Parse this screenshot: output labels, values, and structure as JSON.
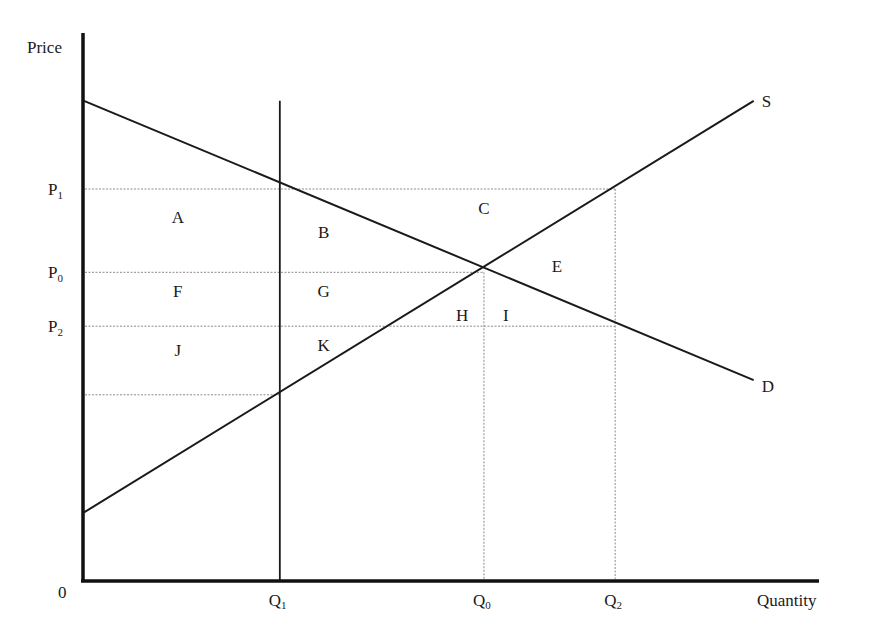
{
  "diagram": {
    "type": "supply-demand",
    "axes": {
      "y_label": "Price",
      "x_label": "Quantity",
      "origin_label": "0"
    },
    "price_levels": [
      {
        "id": "P1",
        "base": "P",
        "sub": "1",
        "value": 0.8
      },
      {
        "id": "P0",
        "base": "P",
        "sub": "0",
        "value": 0.63
      },
      {
        "id": "P2",
        "base": "P",
        "sub": "2",
        "value": 0.52
      },
      {
        "id": "Ps",
        "base": "",
        "sub": "",
        "value": 0.38
      }
    ],
    "quantity_levels": [
      {
        "id": "Q1",
        "base": "Q",
        "sub": "1",
        "value": 0.27
      },
      {
        "id": "Q0",
        "base": "Q",
        "sub": "0",
        "value": 0.55
      },
      {
        "id": "Q2",
        "base": "Q",
        "sub": "2",
        "value": 0.73
      }
    ],
    "curves": {
      "demand": {
        "label": "D",
        "from": [
          0,
          0.98
        ],
        "to": [
          0.92,
          0.41
        ]
      },
      "supply": {
        "label": "S",
        "from": [
          0,
          0.14
        ],
        "to": [
          0.92,
          0.98
        ]
      },
      "quota": {
        "label": "",
        "x": 0.27,
        "y_top": 0.98
      }
    },
    "area_labels": [
      {
        "text": "A",
        "q": 0.13,
        "p": 0.73
      },
      {
        "text": "B",
        "q": 0.33,
        "p": 0.7
      },
      {
        "text": "C",
        "q": 0.55,
        "p": 0.75
      },
      {
        "text": "E",
        "q": 0.65,
        "p": 0.63
      },
      {
        "text": "F",
        "q": 0.13,
        "p": 0.58
      },
      {
        "text": "G",
        "q": 0.33,
        "p": 0.58
      },
      {
        "text": "H",
        "q": 0.52,
        "p": 0.53
      },
      {
        "text": "I",
        "q": 0.58,
        "p": 0.53
      },
      {
        "text": "J",
        "q": 0.13,
        "p": 0.46
      },
      {
        "text": "K",
        "q": 0.33,
        "p": 0.47
      }
    ],
    "colors": {
      "line": "#1a1a1a",
      "guide": "#8a8a8a",
      "background": "#ffffff"
    }
  }
}
